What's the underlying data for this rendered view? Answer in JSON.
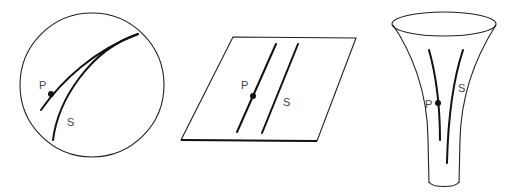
{
  "figure": {
    "panels": [
      {
        "id": "sphere",
        "surface": "sphere",
        "point_label": "P",
        "curve_label": "S"
      },
      {
        "id": "plane",
        "surface": "plane",
        "point_label": "P",
        "curve_label": "S"
      },
      {
        "id": "pseudosphere",
        "surface": "funnel",
        "point_label": "P",
        "curve_label": "S"
      }
    ]
  }
}
